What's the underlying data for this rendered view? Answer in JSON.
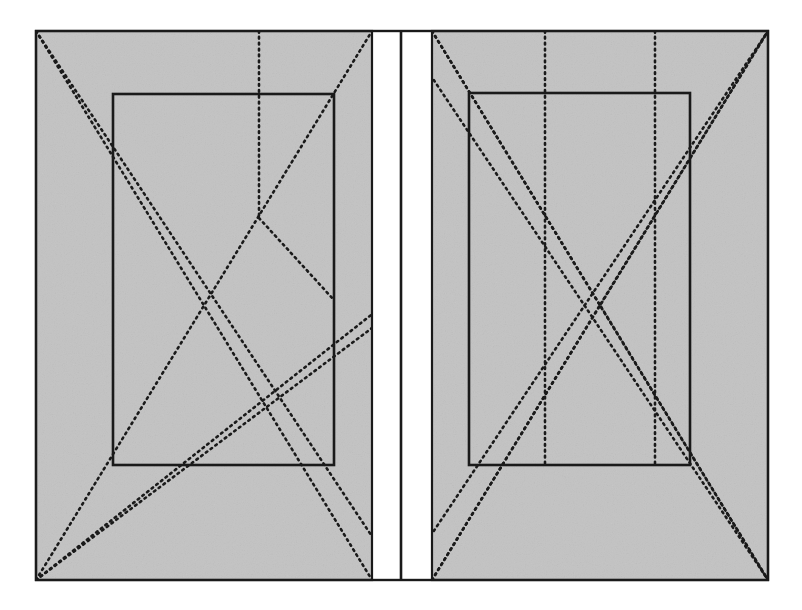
{
  "figure": {
    "caption_bleedthrough": "Construction of the page and the text area",
    "colors": {
      "page_fill": "#c3c3c3",
      "line_stroke": "#1a1a1a",
      "dotted_stroke": "#1a1a1a",
      "background": "#ffffff"
    },
    "canvas": {
      "width": 802,
      "height": 610
    },
    "outer_frame": {
      "x": 36,
      "y": 31,
      "width": 732,
      "height": 549
    },
    "spine": {
      "x": 401,
      "y_top": 31,
      "y_bottom": 580
    },
    "gutter": {
      "left_edge": 372,
      "right_edge": 432
    },
    "left_page": {
      "label": "verso",
      "trim": {
        "x": 36,
        "y": 31,
        "width": 336,
        "height": 549
      },
      "text_block": {
        "x": 113,
        "y": 94,
        "width": 221,
        "height": 371
      }
    },
    "right_page": {
      "label": "recto",
      "trim": {
        "x": 432,
        "y": 31,
        "width": 336,
        "height": 549
      },
      "text_block": {
        "x": 469,
        "y": 93,
        "width": 221,
        "height": 372
      }
    },
    "construction_lines": {
      "style": "dotted",
      "dash_pattern": "1.7 4.2",
      "stroke_width": 2.6,
      "left_page_count": 6,
      "right_page_count": 10
    }
  }
}
